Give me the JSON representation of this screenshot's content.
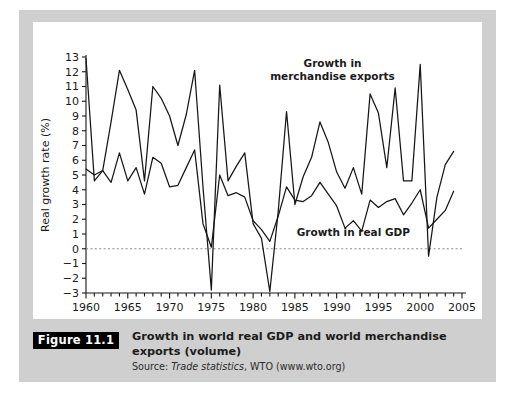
{
  "figure": {
    "tag": "Figure 11.1",
    "title": "Growth in world real GDP and world merchandise exports (volume)",
    "source_prefix": "Source: ",
    "source_italic": "Trade statistics",
    "source_rest": ", WTO (www.wto.org)"
  },
  "colors": {
    "panel": "#cfcfcf",
    "card": "#ffffff",
    "line": "#161616",
    "zero_line": "#8a8a8a",
    "tag_bg": "#000000",
    "tag_fg": "#ffffff"
  },
  "chart_data": {
    "type": "line",
    "title": "Growth in world real GDP and world merchandise exports (volume)",
    "xlabel": "",
    "ylabel": "Real growth rate (%)",
    "xlim": [
      1960,
      2005
    ],
    "ylim": [
      -3,
      13
    ],
    "ytick_values": [
      -3,
      -2,
      -1,
      0,
      1,
      2,
      3,
      4,
      5,
      6,
      7,
      8,
      9,
      10,
      11,
      12,
      13
    ],
    "ytick_labels": [
      "−3",
      "−2",
      "−1",
      "0",
      "1",
      "2",
      "3",
      "4",
      "5",
      "6",
      "7",
      "8",
      "9",
      "10",
      "11",
      "12",
      "13"
    ],
    "xtick_values": [
      1960,
      1965,
      1970,
      1975,
      1980,
      1985,
      1990,
      1995,
      2000,
      2005
    ],
    "xtick_labels": [
      "1960",
      "1965",
      "1970",
      "1975",
      "1980",
      "1985",
      "1990",
      "1995",
      "2000",
      "2005"
    ],
    "xtick_minor_step": 1,
    "grid": false,
    "zero_reference_line": 0,
    "legend_position": "inline-annotations",
    "annotations": [
      {
        "text_line1": "Growth in",
        "text_line2": "merchandise exports",
        "x": 1989.5,
        "y": 12.3
      },
      {
        "text_line1": "Growth in real GDP",
        "text_line2": "",
        "x": 1992.0,
        "y": 0.85
      }
    ],
    "x": [
      1960,
      1961,
      1962,
      1963,
      1964,
      1965,
      1966,
      1967,
      1968,
      1969,
      1970,
      1971,
      1972,
      1973,
      1974,
      1975,
      1976,
      1977,
      1978,
      1979,
      1980,
      1981,
      1982,
      1983,
      1984,
      1985,
      1986,
      1987,
      1988,
      1989,
      1990,
      1991,
      1992,
      1993,
      1994,
      1995,
      1996,
      1997,
      1998,
      1999,
      2000,
      2001,
      2002,
      2003,
      2004
    ],
    "series": [
      {
        "name": "Growth in merchandise exports",
        "values": [
          12.9,
          4.6,
          5.3,
          8.6,
          12.1,
          10.8,
          9.4,
          4.6,
          11.0,
          10.2,
          9.0,
          7.0,
          9.1,
          12.1,
          4.2,
          -2.8,
          11.1,
          4.6,
          5.6,
          6.5,
          1.7,
          0.7,
          -2.9,
          2.5,
          9.3,
          3.0,
          4.9,
          6.2,
          8.6,
          7.2,
          5.2,
          4.1,
          5.5,
          3.7,
          10.5,
          9.2,
          5.5,
          10.9,
          4.6,
          4.6,
          12.5,
          -0.5,
          3.5,
          5.7,
          6.6
        ]
      },
      {
        "name": "Growth in real GDP",
        "values": [
          5.4,
          5.0,
          5.3,
          4.5,
          6.5,
          4.6,
          5.5,
          3.7,
          6.2,
          5.8,
          4.2,
          4.3,
          5.5,
          6.7,
          1.7,
          0.1,
          5.0,
          3.6,
          3.8,
          3.5,
          1.9,
          1.3,
          0.5,
          2.2,
          4.2,
          3.3,
          3.2,
          3.6,
          4.5,
          3.7,
          2.9,
          1.4,
          1.9,
          1.2,
          3.3,
          2.8,
          3.2,
          3.4,
          2.3,
          3.1,
          4.0,
          1.4,
          2.0,
          2.6,
          3.9
        ]
      }
    ]
  }
}
